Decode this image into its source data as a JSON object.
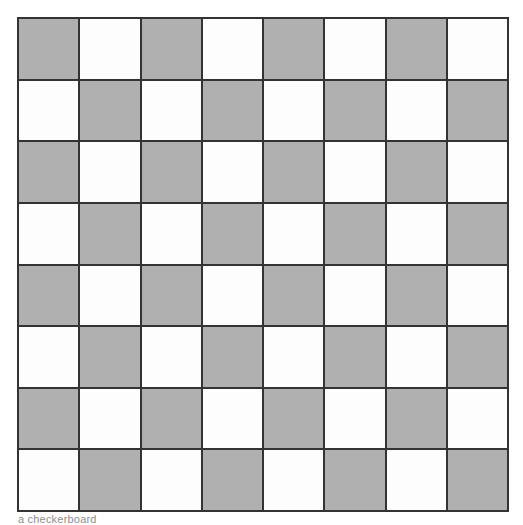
{
  "figure": {
    "name": "checkerboard",
    "width_px": 523,
    "height_px": 525,
    "background_color": "#ffffff"
  },
  "board": {
    "rows": 8,
    "columns": 8,
    "origin_x_px": 17,
    "origin_y_px": 17,
    "width_px": 492,
    "height_px": 495,
    "cell_width_px": 61.5,
    "cell_height_px": 61.9,
    "line_color": "#333333",
    "line_width_px": 2,
    "shaded_color": "#b0b0b0",
    "light_color": "#fdfdfd",
    "top_left_is_shaded": true,
    "pattern": [
      [
        "shaded",
        "light",
        "shaded",
        "light",
        "shaded",
        "light",
        "shaded",
        "light"
      ],
      [
        "light",
        "shaded",
        "light",
        "shaded",
        "light",
        "shaded",
        "light",
        "shaded"
      ],
      [
        "shaded",
        "light",
        "shaded",
        "light",
        "shaded",
        "light",
        "shaded",
        "light"
      ],
      [
        "light",
        "shaded",
        "light",
        "shaded",
        "light",
        "shaded",
        "light",
        "shaded"
      ],
      [
        "shaded",
        "light",
        "shaded",
        "light",
        "shaded",
        "light",
        "shaded",
        "light"
      ],
      [
        "light",
        "shaded",
        "light",
        "shaded",
        "light",
        "shaded",
        "light",
        "shaded"
      ],
      [
        "shaded",
        "light",
        "shaded",
        "light",
        "shaded",
        "light",
        "shaded",
        "light"
      ],
      [
        "light",
        "shaded",
        "light",
        "shaded",
        "light",
        "shaded",
        "light",
        "shaded"
      ]
    ]
  },
  "caption": {
    "clipped": true,
    "text": "a checkerboard"
  }
}
